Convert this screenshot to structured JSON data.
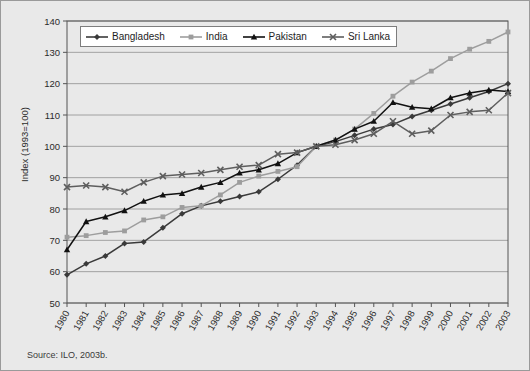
{
  "figure": {
    "source_note": "Source: ILO, 2003b.",
    "ylabel": "Index (1993=100)"
  },
  "legend": {
    "position": "top-inside",
    "entries": [
      {
        "name": "Bangladesh",
        "marker": "diamond-icon",
        "color": "#3a3a3a"
      },
      {
        "name": "India",
        "marker": "square-icon",
        "color": "#9d9d9d"
      },
      {
        "name": "Pakistan",
        "marker": "triangle-icon",
        "color": "#111111"
      },
      {
        "name": "Sri Lanka",
        "marker": "cross-icon",
        "color": "#5e5e5e"
      }
    ]
  },
  "chart_data": {
    "type": "line",
    "title": "",
    "xlabel": "",
    "ylabel": "Index (1993=100)",
    "ylim": [
      50,
      140
    ],
    "ytick_step": 10,
    "yticks": [
      50,
      60,
      70,
      80,
      90,
      100,
      110,
      120,
      130,
      140
    ],
    "grid": true,
    "legend_position": "top-inside",
    "categories": [
      "1980",
      "1981",
      "1982",
      "1983",
      "1984",
      "1985",
      "1986",
      "1987",
      "1988",
      "1989",
      "1990",
      "1991",
      "1992",
      "1993",
      "1994",
      "1995",
      "1996",
      "1997",
      "1998",
      "1999",
      "2000",
      "2001",
      "2002",
      "2003"
    ],
    "series": [
      {
        "name": "Bangladesh",
        "color": "#3a3a3a",
        "marker": "diamond",
        "values": [
          59,
          62.5,
          65,
          69,
          69.5,
          74,
          78.5,
          81,
          82.5,
          84,
          85.5,
          89.5,
          94,
          100,
          101.5,
          103.5,
          105.5,
          107,
          109.5,
          111.5,
          113.5,
          115.5,
          117.5,
          120
        ]
      },
      {
        "name": "India",
        "color": "#9d9d9d",
        "marker": "square",
        "values": [
          71,
          71.5,
          72.5,
          73,
          76.5,
          77.5,
          80.5,
          81,
          84.5,
          88.5,
          90.5,
          92,
          93.5,
          100,
          102,
          105.5,
          110.5,
          116,
          120.5,
          124,
          128,
          131,
          133.5,
          136.5
        ]
      },
      {
        "name": "Pakistan",
        "color": "#111111",
        "marker": "triangle",
        "values": [
          67,
          76,
          77.5,
          79.5,
          82.5,
          84.5,
          85,
          87,
          88.5,
          91.5,
          92.5,
          94.5,
          98,
          100,
          102,
          105.5,
          108,
          114,
          112.5,
          112,
          115.5,
          117,
          118,
          117.5
        ]
      },
      {
        "name": "Sri Lanka",
        "color": "#5e5e5e",
        "marker": "cross",
        "values": [
          87,
          87.5,
          87,
          85.5,
          88.5,
          90.5,
          91,
          91.5,
          92.5,
          93.5,
          94,
          97.5,
          98,
          100,
          100.5,
          102,
          104,
          108,
          104,
          105,
          110,
          111,
          111.5,
          117
        ]
      }
    ]
  }
}
